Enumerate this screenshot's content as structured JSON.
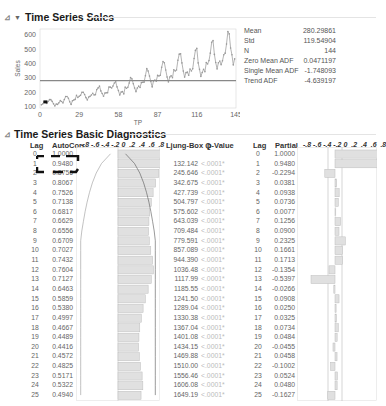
{
  "sections": {
    "sales": {
      "title": "Time Series Sales"
    },
    "diagnostics": {
      "title": "Time Series Basic Diagnostics"
    }
  },
  "stats": [
    {
      "label": "Mean",
      "value": "280.29861"
    },
    {
      "label": "Std",
      "value": "119.54904"
    },
    {
      "label": "N",
      "value": "144"
    },
    {
      "label": "Zero Mean ADF",
      "value": "0.0471197"
    },
    {
      "label": "Single Mean ADF",
      "value": "-1.748093"
    },
    {
      "label": "Trend ADF",
      "value": "-4.639197"
    }
  ],
  "chart_data": [
    {
      "type": "line",
      "title": "Time Series Sales",
      "xlabel": "TP",
      "ylabel": "Sales",
      "x_ticks": [
        "0",
        "29",
        "58",
        "87",
        "116",
        "145"
      ],
      "y_ticks": [
        "100",
        "200",
        "300",
        "400",
        "500",
        "600"
      ],
      "xlim": [
        0,
        145
      ],
      "ylim": [
        90,
        640
      ],
      "mean_line": 280.29861,
      "series": [
        {
          "name": "Sales",
          "values": [
            112,
            118,
            132,
            129,
            121,
            135,
            148,
            148,
            136,
            119,
            104,
            118,
            115,
            126,
            141,
            135,
            125,
            149,
            170,
            170,
            158,
            133,
            114,
            140,
            145,
            150,
            178,
            163,
            172,
            178,
            199,
            199,
            184,
            162,
            146,
            166,
            171,
            180,
            193,
            181,
            183,
            218,
            230,
            242,
            209,
            191,
            172,
            194,
            196,
            196,
            236,
            235,
            229,
            243,
            264,
            272,
            237,
            211,
            180,
            201,
            204,
            188,
            235,
            227,
            234,
            264,
            302,
            293,
            259,
            229,
            203,
            229,
            242,
            233,
            267,
            269,
            270,
            315,
            364,
            347,
            312,
            274,
            237,
            278,
            284,
            277,
            317,
            313,
            318,
            374,
            413,
            405,
            355,
            306,
            271,
            306,
            315,
            301,
            356,
            348,
            355,
            422,
            465,
            467,
            404,
            347,
            305,
            336,
            340,
            318,
            362,
            348,
            363,
            435,
            491,
            505,
            404,
            359,
            310,
            337,
            360,
            342,
            406,
            396,
            420,
            472,
            548,
            559,
            463,
            407,
            362,
            405,
            417,
            391,
            419,
            461,
            472,
            535,
            622,
            606,
            508,
            461,
            390,
            432
          ]
        }
      ]
    },
    {
      "type": "table",
      "title": "Time Series Basic Diagnostics - Autocorrelation",
      "columns": [
        "Lag",
        "AutoCorr",
        "Ljung-Box Q",
        "p-Value"
      ],
      "axis_ticks": [
        "-.8",
        "-.6",
        "-.4",
        "-.2",
        "0",
        ".2",
        ".4",
        ".6",
        ".8"
      ],
      "lags": [
        0,
        1,
        2,
        3,
        4,
        5,
        6,
        7,
        8,
        9,
        10,
        11,
        12,
        13,
        14,
        15,
        16,
        17,
        18,
        19,
        20,
        21,
        22,
        23,
        24,
        25
      ],
      "autocorr": [
        1.0,
        0.948,
        0.8756,
        0.8067,
        0.7526,
        0.7138,
        0.6817,
        0.6629,
        0.6556,
        0.6709,
        0.7027,
        0.7432,
        0.7604,
        0.7127,
        0.6463,
        0.5859,
        0.538,
        0.4997,
        0.4667,
        0.4489,
        0.4416,
        0.4572,
        0.4825,
        0.5171,
        0.5322,
        0.494
      ],
      "ljung_box_q": [
        "",
        "132.142",
        "245.646",
        "342.675",
        "427.739",
        "504.797",
        "575.602",
        "643.039",
        "709.484",
        "779.591",
        "857.089",
        "944.390",
        "1036.48",
        "1117.99",
        "1185.55",
        "1241.50",
        "1289.04",
        "1330.38",
        "1367.04",
        "1401.08",
        "1434.15",
        "1469.88",
        "1510.00",
        "1556.46",
        "1606.08",
        "1649.19"
      ],
      "p_value": [
        "",
        "<.0001*",
        "<.0001*",
        "<.0001*",
        "<.0001*",
        "<.0001*",
        "<.0001*",
        "<.0001*",
        "<.0001*",
        "<.0001*",
        "<.0001*",
        "<.0001*",
        "<.0001*",
        "<.0001*",
        "<.0001*",
        "<.0001*",
        "<.0001*",
        "<.0001*",
        "<.0001*",
        "<.0001*",
        "<.0001*",
        "<.0001*",
        "<.0001*",
        "<.0001*",
        "<.0001*",
        "<.0001*"
      ]
    },
    {
      "type": "table",
      "title": "Time Series Basic Diagnostics - Partial Autocorrelation",
      "columns": [
        "Lag",
        "Partial"
      ],
      "axis_ticks": [
        "-.8",
        "-.6",
        "-.4",
        "-.2",
        "0",
        ".2",
        ".4",
        ".6",
        ".8"
      ],
      "lags": [
        0,
        1,
        2,
        3,
        4,
        5,
        6,
        7,
        8,
        9,
        10,
        11,
        12,
        13,
        14,
        15,
        16,
        17,
        18,
        19,
        20,
        21,
        22,
        23,
        24,
        25
      ],
      "partial": [
        1.0,
        0.948,
        -0.2294,
        0.0381,
        0.0938,
        0.0736,
        0.0077,
        0.1256,
        0.09,
        0.2325,
        0.1661,
        0.1713,
        -0.1354,
        -0.5397,
        -0.0266,
        0.0908,
        0.025,
        0.0325,
        0.0734,
        0.0484,
        -0.0455,
        0.0458,
        -0.1002,
        0.0524,
        0.048,
        -0.1627
      ]
    }
  ],
  "diagnostics": {
    "headers": {
      "lag": "Lag",
      "autocorr": "AutoCorr",
      "axis": "-.8 -.6 -.4 -.2 0  .2  .4  .6  .8",
      "ljung": "Ljung-Box Q",
      "pvalue": "p-Value",
      "lag2": "Lag",
      "partial": "Partial",
      "axis2": "-.8 -.6 -.4 -.2 0  .2  .4  .6  .8"
    },
    "ac_text": [
      "1.0000",
      "0.9480",
      "0.8756",
      "0.8067",
      "0.7526",
      "0.7138",
      "0.6817",
      "0.6629",
      "0.6556",
      "0.6709",
      "0.7027",
      "0.7432",
      "0.7604",
      "0.7127",
      "0.6463",
      "0.5859",
      "0.5380",
      "0.4997",
      "0.4667",
      "0.4489",
      "0.4416",
      "0.4572",
      "0.4825",
      "0.5171",
      "0.5322",
      "0.4940"
    ],
    "pac_text": [
      "1.0000",
      "0.9480",
      "-0.2294",
      "0.0381",
      "0.0938",
      "0.0736",
      "0.0077",
      "0.1256",
      "0.0900",
      "0.2325",
      "0.1661",
      "0.1713",
      "-0.1354",
      "-0.5397",
      "-0.0266",
      "0.0908",
      "0.0250",
      "0.0325",
      "0.0734",
      "0.0484",
      "-0.0455",
      "0.0458",
      "-0.1002",
      "0.0524",
      "0.0480",
      "-0.1627"
    ]
  }
}
